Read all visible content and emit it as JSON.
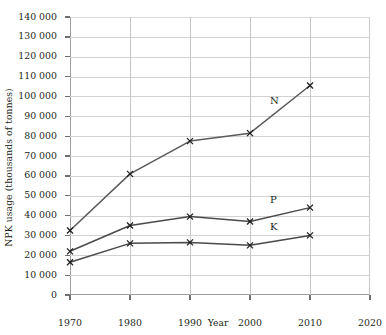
{
  "chart_data": {
    "type": "line",
    "title": "",
    "xlabel": "Year",
    "ylabel": "NPK usage (thousands of tonnes)",
    "x": [
      1970,
      1980,
      1990,
      2000,
      2010
    ],
    "xlim": [
      1970,
      2020
    ],
    "ylim": [
      0,
      140000
    ],
    "xticks": [
      1970,
      1980,
      1990,
      2000,
      2010,
      2020
    ],
    "yticks": [
      0,
      10000,
      20000,
      30000,
      40000,
      50000,
      60000,
      70000,
      80000,
      90000,
      100000,
      110000,
      120000,
      130000,
      140000
    ],
    "ytick_labels": [
      "0",
      "10 000",
      "20 000",
      "30 000",
      "40 000",
      "50 000",
      "60 000",
      "70 000",
      "80 000",
      "90 000",
      "100 000",
      "110 000",
      "120 000",
      "130 000",
      "140 000"
    ],
    "xtick_labels": [
      "1970",
      "1980",
      "1990",
      "2000",
      "2010",
      "2020"
    ],
    "grid": true,
    "legend_position": "inline-annotation",
    "marker": "x",
    "series": [
      {
        "name": "N",
        "label": "N",
        "color": "#5a5a5a",
        "values": [
          32500,
          61000,
          77500,
          81500,
          105500
        ],
        "label_x": 2004,
        "label_y": 97000
      },
      {
        "name": "P",
        "label": "P",
        "color": "#4a4a4a",
        "values": [
          22000,
          35000,
          39500,
          37000,
          44000
        ],
        "label_x": 2004,
        "label_y": 47500
      },
      {
        "name": "K",
        "label": "K",
        "color": "#4a4a4a",
        "values": [
          16500,
          26000,
          26500,
          25000,
          30000
        ],
        "label_x": 2004,
        "label_y": 33500
      }
    ]
  },
  "colors": {
    "background": "#ffffff",
    "gridline": "#d2d2d2",
    "axis": "#9d9d9d",
    "text": "#231f20"
  }
}
